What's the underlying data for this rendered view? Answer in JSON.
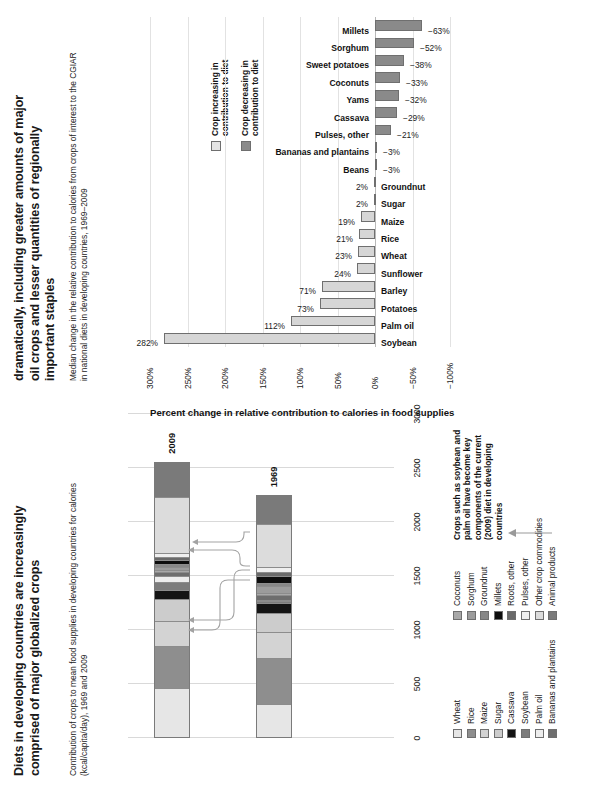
{
  "stacked_panel": {
    "title": "Diets in developing countries are increasingly comprised of major globalized crops",
    "subtitle": "Contribution of crops to mean food supplies in developing countries for calories (kcal/capita/day), 1969 and 2009",
    "callout": "Crops such as soybean and palm oil have become key components of the current (2009) diet in developing countries",
    "callout_icon": "up-arrow-icon"
  },
  "pct_panel": {
    "title": "dramatically, including greater amounts of major oil crops and lesser quantities of regionally important staples",
    "subtitle": "Median change in the relative contribution to calories from crops of interest to the CGIAR in national diets in developing countries, 1969–2009",
    "axis_title": "Percent change in relative contribution to calories in food supplies",
    "legend": [
      {
        "label": "Crop increasing in contribution to diet",
        "color": "#e4e4e4"
      },
      {
        "label": "Crop decreasing in contribution to diet",
        "color": "#8a8a8a"
      }
    ]
  },
  "chart_data": [
    {
      "type": "bar",
      "id": "stacked-calories",
      "orientation": "horizontal-stacked",
      "title": "Diets in developing countries are increasingly comprised of major globalized crops",
      "subtitle": "Contribution of crops to mean food supplies in developing countries for calories (kcal/capita/day), 1969 and 2009",
      "xlabel": "kcal/capita/day",
      "ylabel": "",
      "xlim": [
        0,
        3000
      ],
      "xticks": [
        "0",
        "500",
        "1000",
        "1500",
        "2000",
        "2500",
        "3000"
      ],
      "grid": true,
      "legend_position": "right",
      "categories": [
        "1969",
        "2009"
      ],
      "series": [
        {
          "name": "Wheat",
          "color": "#e6e6e6",
          "values": [
            295,
            445
          ]
        },
        {
          "name": "Rice",
          "color": "#8e8e8e",
          "values": [
            430,
            392
          ]
        },
        {
          "name": "Maize",
          "color": "#d3d3d3",
          "values": [
            245,
            240
          ]
        },
        {
          "name": "Sugar",
          "color": "#cccccc",
          "values": [
            175,
            200
          ]
        },
        {
          "name": "Cassava",
          "color": "#141414",
          "values": [
            95,
            83
          ]
        },
        {
          "name": "Soybean",
          "color": "#7c7c7c",
          "values": [
            22,
            72
          ]
        },
        {
          "name": "Palm oil",
          "color": "#ededed",
          "values": [
            10,
            60
          ]
        },
        {
          "name": "Bananas and plantains",
          "color": "#6e6e6e",
          "values": [
            40,
            36
          ]
        },
        {
          "name": "Coconuts",
          "color": "#a8a8a8",
          "values": [
            22,
            20
          ]
        },
        {
          "name": "Sorghum",
          "color": "#9c9c9c",
          "values": [
            62,
            32
          ]
        },
        {
          "name": "Groundnut",
          "color": "#878787",
          "values": [
            30,
            28
          ]
        },
        {
          "name": "Millets",
          "color": "#0d0d0d",
          "values": [
            70,
            34
          ]
        },
        {
          "name": "Roots, other",
          "color": "#6a6a6a",
          "values": [
            38,
            30
          ]
        },
        {
          "name": "Pulses, other",
          "color": "#efefef",
          "values": [
            45,
            36
          ]
        },
        {
          "name": "Other crop commodities",
          "color": "#dcdcdc",
          "values": [
            400,
            520
          ]
        },
        {
          "name": "Animal products",
          "color": "#7a7a7a",
          "values": [
            268,
            330
          ]
        }
      ],
      "totals": [
        2247,
        2558
      ],
      "annotation": "Crops such as soybean and palm oil have become key components of the current (2009) diet in developing countries"
    },
    {
      "type": "bar",
      "id": "percent-change",
      "orientation": "vertical",
      "title": "dramatically, including greater amounts of major oil crops and lesser quantities of regionally important staples",
      "subtitle": "Median change in the relative contribution to calories from crops of interest to the CGIAR in national diets in developing countries, 1969–2009",
      "xlabel": "",
      "ylabel": "Percent change in relative contribution to calories in food supplies",
      "ylim": [
        -100,
        300
      ],
      "yticks": [
        "-100%",
        "-50%",
        "0%",
        "50%",
        "100%",
        "150%",
        "200%",
        "250%",
        "300%"
      ],
      "grid": true,
      "legend_position": "inside-right",
      "categories": [
        "Soybean",
        "Palm oil",
        "Potatoes",
        "Barley",
        "Sunflower",
        "Wheat",
        "Rice",
        "Maize",
        "Sugar",
        "Groundnut",
        "Beans",
        "Bananas and plantains",
        "Pulses, other",
        "Cassava",
        "Yams",
        "Coconuts",
        "Sweet potatoes",
        "Sorghum",
        "Millets"
      ],
      "values": [
        282,
        112,
        73,
        71,
        24,
        23,
        21,
        19,
        2,
        2,
        -3,
        -3,
        -21,
        -29,
        -32,
        -33,
        -38,
        -52,
        -63
      ],
      "value_labels": [
        "282%",
        "112%",
        "73%",
        "71%",
        "24%",
        "23%",
        "21%",
        "19%",
        "2%",
        "2%",
        "−3%",
        "−3%",
        "−21%",
        "−29%",
        "−32%",
        "−33%",
        "−38%",
        "−52%",
        "−63%"
      ]
    }
  ]
}
